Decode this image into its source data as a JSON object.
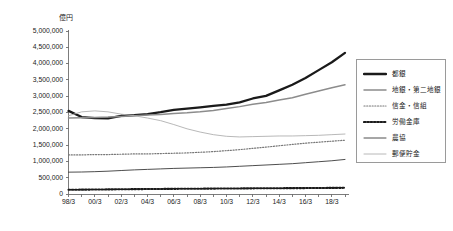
{
  "chart_data": {
    "type": "line",
    "title": "",
    "xlabel": "",
    "ylabel": "億円",
    "unit_label": "億円",
    "grid": false,
    "legend_position": "right",
    "ylim": [
      0,
      5000000
    ],
    "ytick_step": 500000,
    "yticks": [
      "5,000,000",
      "4,500,000",
      "4,000,000",
      "3,500,000",
      "3,000,000",
      "2,500,000",
      "2,000,000",
      "1,500,000",
      "1,000,000",
      "500,000",
      "0"
    ],
    "ytick_values": [
      5000000,
      4500000,
      4000000,
      3500000,
      3000000,
      2500000,
      2000000,
      1500000,
      1000000,
      500000,
      0
    ],
    "x": [
      "98/3",
      "99/3",
      "00/3",
      "01/3",
      "02/3",
      "03/3",
      "04/3",
      "05/3",
      "06/3",
      "07/3",
      "08/3",
      "09/3",
      "10/3",
      "11/3",
      "12/3",
      "13/3",
      "14/3",
      "15/3",
      "16/3",
      "17/3",
      "18/3",
      "19/3"
    ],
    "xtick_labels": [
      "98/3",
      "00/3",
      "02/3",
      "04/3",
      "06/3",
      "08/3",
      "10/3",
      "12/3",
      "14/3",
      "16/3",
      "18/3"
    ],
    "xtick_indices": [
      0,
      2,
      4,
      6,
      8,
      10,
      12,
      14,
      16,
      18,
      20
    ],
    "series": [
      {
        "name": "都銀",
        "style": "thick-solid",
        "color": "#1a1a1a",
        "values": [
          2550000,
          2360000,
          2330000,
          2320000,
          2400000,
          2420000,
          2450000,
          2510000,
          2580000,
          2620000,
          2660000,
          2700000,
          2740000,
          2810000,
          2930000,
          3010000,
          3180000,
          3350000,
          3560000,
          3800000,
          4040000,
          4330000
        ]
      },
      {
        "name": "地銀・第二地銀",
        "style": "medium-solid",
        "color": "#8c8c8c",
        "values": [
          2330000,
          2340000,
          2350000,
          2360000,
          2380000,
          2400000,
          2420000,
          2440000,
          2470000,
          2490000,
          2520000,
          2560000,
          2620000,
          2680000,
          2750000,
          2810000,
          2880000,
          2950000,
          3060000,
          3160000,
          3260000,
          3350000
        ]
      },
      {
        "name": "信金・信組",
        "style": "fine-dotted",
        "color": "#777777",
        "values": [
          1200000,
          1200000,
          1210000,
          1210000,
          1220000,
          1230000,
          1230000,
          1240000,
          1250000,
          1260000,
          1280000,
          1300000,
          1330000,
          1360000,
          1400000,
          1440000,
          1480000,
          1520000,
          1560000,
          1590000,
          1620000,
          1650000
        ]
      },
      {
        "name": "労働金庫",
        "style": "bold-dotted",
        "color": "#1a1a1a",
        "values": [
          130000,
          133000,
          137000,
          141000,
          145000,
          149000,
          152000,
          155000,
          158000,
          160000,
          163000,
          166000,
          169000,
          171000,
          174000,
          176000,
          178000,
          180000,
          182000,
          185000,
          187000,
          190000
        ]
      },
      {
        "name": "農協",
        "style": "thin-solid",
        "color": "#3a3a3a",
        "values": [
          670000,
          675000,
          685000,
          700000,
          720000,
          740000,
          755000,
          770000,
          785000,
          795000,
          805000,
          815000,
          830000,
          850000,
          870000,
          890000,
          910000,
          930000,
          960000,
          990000,
          1020000,
          1060000
        ]
      },
      {
        "name": "郵便貯金",
        "style": "thin-light",
        "color": "#b0b0b0",
        "values": [
          2400000,
          2520000,
          2550000,
          2520000,
          2450000,
          2400000,
          2330000,
          2250000,
          2130000,
          2000000,
          1900000,
          1820000,
          1770000,
          1750000,
          1760000,
          1770000,
          1780000,
          1780000,
          1790000,
          1800000,
          1820000,
          1840000
        ]
      }
    ]
  },
  "legend": {
    "items": [
      {
        "label": "都銀"
      },
      {
        "label": "地銀・第二地銀"
      },
      {
        "label": "信金・信組"
      },
      {
        "label": "労働金庫"
      },
      {
        "label": "農協"
      },
      {
        "label": "郵便貯金"
      }
    ]
  }
}
